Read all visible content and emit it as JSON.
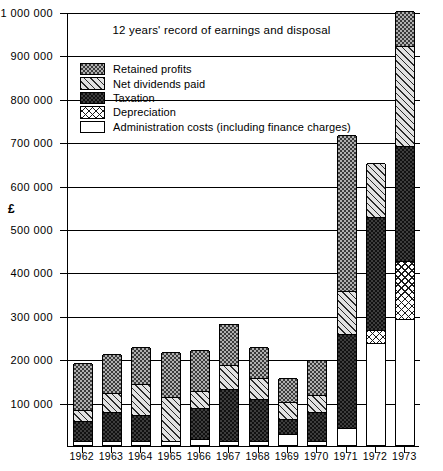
{
  "chart_data": {
    "type": "bar",
    "subtype": "stacked-bar",
    "title": "12 years' record of earnings and disposal",
    "xlabel": "",
    "ylabel": "£",
    "ylim": [
      0,
      1000000
    ],
    "ytick_step": 100000,
    "grid": true,
    "legend_position": "upper-left-inside",
    "categories": [
      "1962",
      "1963",
      "1964",
      "1965",
      "1966",
      "1967",
      "1968",
      "1969",
      "1970",
      "1971",
      "1972",
      "1973"
    ],
    "ytick_labels": [
      "1 000 000",
      "900 000",
      "800 000",
      "700 000",
      "600 000",
      "500 000",
      "400 000",
      "300 000",
      "200 000",
      "100 000"
    ],
    "ytick_values": [
      1000000,
      900000,
      800000,
      700000,
      600000,
      500000,
      400000,
      300000,
      200000,
      100000
    ],
    "series": [
      {
        "name": "Retained profits",
        "pattern": "fine-dot-grey",
        "values": [
          110000,
          90000,
          85000,
          105000,
          95000,
          95000,
          70000,
          55000,
          80000,
          360000,
          0,
          80000
        ]
      },
      {
        "name": "Net dividends paid",
        "pattern": "diagonal-hatch",
        "values": [
          25000,
          45000,
          70000,
          100000,
          40000,
          55000,
          50000,
          40000,
          40000,
          100000,
          125000,
          230000
        ]
      },
      {
        "name": "Taxation",
        "pattern": "dark-dot",
        "values": [
          45000,
          65000,
          60000,
          0,
          70000,
          120000,
          95000,
          35000,
          65000,
          215000,
          260000,
          265000
        ]
      },
      {
        "name": "Depreciation",
        "pattern": "cross-hatch",
        "values": [
          0,
          0,
          0,
          0,
          0,
          0,
          0,
          0,
          0,
          0,
          30000,
          135000
        ]
      },
      {
        "name": "Administration costs (including finance charges)",
        "pattern": "solid-white",
        "values": [
          10000,
          10000,
          10000,
          10000,
          15000,
          10000,
          10000,
          25000,
          10000,
          40000,
          235000,
          290000
        ]
      }
    ],
    "totals": [
      190000,
      210000,
      225000,
      215000,
      220000,
      280000,
      225000,
      155000,
      195000,
      715000,
      650000,
      1000000
    ],
    "stack_order_bottom_to_top": [
      "Administration costs (including finance charges)",
      "Depreciation",
      "Taxation",
      "Net dividends paid",
      "Retained profits"
    ],
    "stack_boundaries": {
      "1962": [
        0,
        10000,
        10000,
        55000,
        80000,
        190000
      ],
      "1963": [
        0,
        10000,
        10000,
        75000,
        120000,
        210000
      ],
      "1964": [
        0,
        10000,
        10000,
        70000,
        140000,
        225000
      ],
      "1965": [
        0,
        10000,
        10000,
        10000,
        110000,
        215000
      ],
      "1966": [
        0,
        15000,
        15000,
        85000,
        125000,
        220000
      ],
      "1967": [
        0,
        10000,
        10000,
        130000,
        185000,
        280000
      ],
      "1968": [
        0,
        10000,
        10000,
        105000,
        155000,
        225000
      ],
      "1969": [
        0,
        25000,
        25000,
        60000,
        100000,
        155000
      ],
      "1970": [
        0,
        10000,
        10000,
        75000,
        115000,
        195000
      ],
      "1971": [
        0,
        40000,
        40000,
        255000,
        355000,
        715000
      ],
      "1972": [
        0,
        235000,
        265000,
        525000,
        650000,
        650000
      ],
      "1973": [
        0,
        290000,
        425000,
        690000,
        920000,
        1000000
      ]
    }
  },
  "legend": {
    "items": [
      {
        "label": "Retained profits"
      },
      {
        "label": "Net dividends paid"
      },
      {
        "label": "Taxation"
      },
      {
        "label": "Depreciation"
      },
      {
        "label": "Administration costs (including finance charges)"
      }
    ]
  }
}
